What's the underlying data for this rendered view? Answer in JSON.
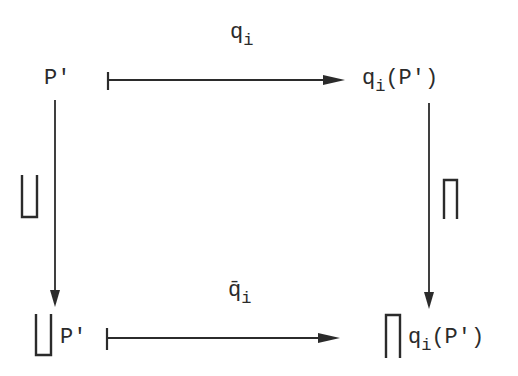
{
  "diagram": {
    "type": "commutative-square",
    "colors": {
      "ink": "#2b2b2b",
      "background": "#ffffff"
    },
    "nodes": {
      "top_left": {
        "base": "P'"
      },
      "top_right": {
        "base": "q",
        "sub": "i",
        "arg": "(P')"
      },
      "bottom_left": {
        "op": "∐",
        "base": "P'"
      },
      "bottom_right": {
        "op": "∏",
        "base": "q",
        "sub": "i",
        "arg": "(P')"
      }
    },
    "arrows": {
      "top": {
        "style": "maps-to",
        "label_base": "q",
        "label_sub": "i"
      },
      "bottom": {
        "style": "maps-to",
        "label_base": "q̄",
        "label_sub": "i"
      },
      "left": {
        "style": "arrow",
        "label": "∐"
      },
      "right": {
        "style": "arrow",
        "label": "∏"
      }
    }
  }
}
